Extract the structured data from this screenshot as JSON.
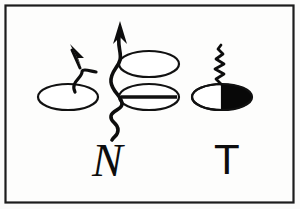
{
  "figure": {
    "background_color": "#fbfbfa",
    "ink_color": "#0d0d0d",
    "border_color": "#1c1c1c",
    "fill_black": "#080808",
    "fill_white": "#ffffff"
  },
  "labels": {
    "left_group": "N",
    "right_group": "T"
  },
  "elements": {
    "left_ellipse": {
      "name": "open-ellipse-left",
      "fill": "white",
      "bisected": false
    },
    "center_top_ellipse": {
      "name": "open-ellipse-center-top",
      "fill": "white",
      "bisected": false
    },
    "center_bottom_ellipse": {
      "name": "bisected-ellipse-center-bottom",
      "fill": "white",
      "bisected": true
    },
    "right_ellipse": {
      "name": "half-filled-ellipse-right",
      "fill": "half-black",
      "bisected": false
    },
    "short_arrow": {
      "name": "short-curved-arrow",
      "direction": "up-left"
    },
    "long_arrow": {
      "name": "long-wavy-arrow",
      "direction": "up"
    },
    "zigzag": {
      "name": "zigzag-coil",
      "direction": "up"
    }
  }
}
